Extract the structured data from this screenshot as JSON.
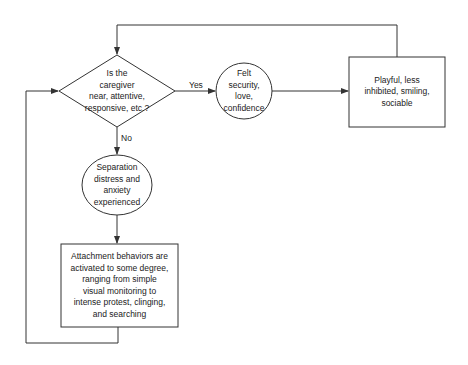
{
  "diagram": {
    "type": "flowchart",
    "nodes": {
      "decision": {
        "shape": "diamond",
        "text": "Is the\ncaregiver\nnear, attentive,\nresponsive, etc.?"
      },
      "felt_security": {
        "shape": "circle",
        "text": "Felt\nsecurity,\nlove,\nconfidence"
      },
      "playful": {
        "shape": "rectangle",
        "text": "Playful, less\ninhibited, smiling,\nsociable"
      },
      "separation": {
        "shape": "ellipse",
        "text": "Separation\ndistress and\nanxiety\nexperienced"
      },
      "attachment": {
        "shape": "rectangle",
        "text": "Attachment behaviors are\nactivated to some degree,\nranging from simple\nvisual monitoring to\nintense protest, clinging,\nand searching"
      }
    },
    "edges": {
      "yes_label": "Yes",
      "no_label": "No"
    },
    "colors": {
      "stroke": "#333333",
      "text": "#222222",
      "background": "#ffffff"
    }
  }
}
